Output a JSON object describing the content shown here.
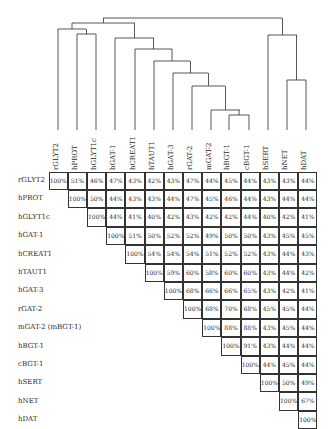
{
  "labels": [
    "rGLYT2",
    "hPROT",
    "hGLYT1c",
    "hGAT-1",
    "hCREAT1",
    "hTAUT1",
    "hGAT-3",
    "rGAT-2",
    "mGAT-2",
    "hBGT-1",
    "cBGT-1",
    "hSERT",
    "hNET",
    "hDAT"
  ],
  "row_labels": [
    "rGLYT2",
    "hPROT",
    "hGLYT1c",
    "hGAT-1",
    "hCREAT1",
    "hTAUT1",
    "hGAT-3",
    "rGAT-2",
    "mGAT-2 (mBGT-1)",
    "hBGT-1",
    "cBGT-1",
    "hSERT",
    "hNET",
    "hDAT"
  ],
  "matrix": [
    [
      "100%",
      "51%",
      "46%",
      "47%",
      "43%",
      "42%",
      "43%",
      "47%",
      "44%",
      "45%",
      "44%",
      "43%",
      "43%",
      "44%"
    ],
    [
      "100%",
      "50%",
      "44%",
      "43%",
      "43%",
      "44%",
      "47%",
      "45%",
      "46%",
      "44%",
      "43%",
      "44%",
      "44%"
    ],
    [
      "100%",
      "44%",
      "41%",
      "40%",
      "42%",
      "43%",
      "42%",
      "42%",
      "44%",
      "40%",
      "42%",
      "41%"
    ],
    [
      "100%",
      "51%",
      "50%",
      "52%",
      "52%",
      "49%",
      "50%",
      "50%",
      "43%",
      "45%",
      "45%"
    ],
    [
      "100%",
      "54%",
      "54%",
      "54%",
      "51%",
      "52%",
      "52%",
      "43%",
      "44%",
      "43%"
    ],
    [
      "100%",
      "59%",
      "60%",
      "58%",
      "60%",
      "60%",
      "43%",
      "44%",
      "42%"
    ],
    [
      "100%",
      "68%",
      "66%",
      "66%",
      "65%",
      "43%",
      "42%",
      "41%"
    ],
    [
      "100%",
      "68%",
      "70%",
      "68%",
      "45%",
      "45%",
      "44%"
    ],
    [
      "100%",
      "88%",
      "88%",
      "43%",
      "45%",
      "44%"
    ],
    [
      "100%",
      "91%",
      "43%",
      "44%",
      "44%"
    ],
    [
      "100%",
      "44%",
      "45%",
      "44%"
    ],
    [
      "100%",
      "50%",
      "49%"
    ],
    [
      "100%",
      "67%"
    ],
    [
      "100%"
    ]
  ],
  "dendrogram": {
    "leaf_x": [
      58,
      77,
      96,
      115,
      135,
      154,
      173,
      192,
      211,
      229,
      249,
      268,
      287,
      306
    ],
    "leaf_bottom_y": 130,
    "clusters": [
      {
        "name": "hBGT-1+cBGT-1",
        "left": 229,
        "right": 249,
        "y": 115
      },
      {
        "name": "mGAT-2+BGT",
        "left": 211,
        "right": 240,
        "y": 110
      },
      {
        "name": "rGAT-2+",
        "left": 192,
        "right": 225,
        "y": 86
      },
      {
        "name": "hGAT-3+",
        "left": 173,
        "right": 208,
        "y": 73
      },
      {
        "name": "hTAUT1+",
        "left": 154,
        "right": 190,
        "y": 61
      },
      {
        "name": "hCREAT1+",
        "left": 135,
        "right": 172,
        "y": 49
      },
      {
        "name": "hGAT-1+",
        "left": 115,
        "right": 154,
        "y": 38
      },
      {
        "name": "hPROT+hGLYT1c",
        "left": 77,
        "right": 96,
        "y": 34
      },
      {
        "name": "rGLYT2+",
        "left": 58,
        "right": 86,
        "y": 29
      },
      {
        "name": "GLY+GABA",
        "left": 72,
        "right": 135,
        "y": 23
      },
      {
        "name": "hNET+hDAT",
        "left": 287,
        "right": 306,
        "y": 80
      },
      {
        "name": "hSERT+",
        "left": 268,
        "right": 297,
        "y": 35
      },
      {
        "name": "root",
        "left": 103,
        "right": 282,
        "y": 18
      }
    ]
  }
}
